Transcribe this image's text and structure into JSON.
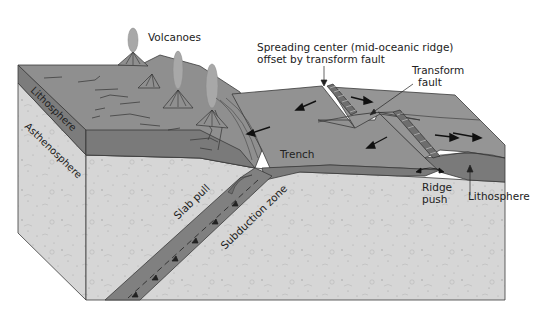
{
  "diagram": {
    "type": "block-diagram",
    "colors": {
      "background": "#ffffff",
      "top_surface": "#8f8f8f",
      "lithosphere_band": "#7a7a7a",
      "asthenosphere": "#d4d4d4",
      "slab": "#808080",
      "volcano_plume": "#a8a8a8",
      "outline": "#3a3a3a",
      "mantle_wedge": "#6e6e6e"
    },
    "labels": {
      "volcanoes": "Volcanoes",
      "spreading_center_line1": "Spreading center (mid-oceanic ridge)",
      "spreading_center_line2": "offset by transform fault",
      "transform_fault_line1": "Transform",
      "transform_fault_line2": "fault",
      "lithosphere_side": "Lithosphere",
      "asthenosphere_side": "Asthenosphere",
      "trench": "Trench",
      "slab_pull": "Slab pull",
      "subduction_zone": "Subduction zone",
      "ridge_push_line1": "Ridge",
      "ridge_push_line2": "push",
      "lithosphere_right": "Lithosphere"
    }
  }
}
